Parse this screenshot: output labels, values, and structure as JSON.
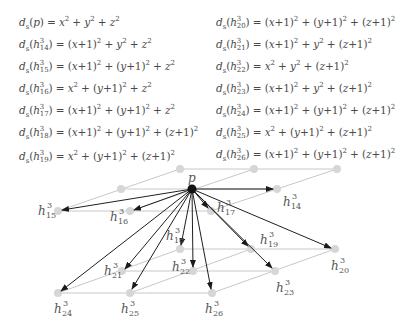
{
  "equations": {
    "left": [
      {
        "lhs": "d_s(p)",
        "rhs": "x^2 + y^2 + z^2",
        "text": "ds(p) = x² + y² + z²"
      },
      {
        "lhs": "d_s(h^3_14)",
        "rhs": "(x+1)^2 + y^2 + z^2",
        "text": "ds(h³₁₄) = (x+1)² + y² + z²"
      },
      {
        "lhs": "d_s(h^3_15)",
        "rhs": "(x+1)^2 + (y+1)^2 + z^2",
        "text": "ds(h³₁₅) = (x+1)² + (y+1)² + z²"
      },
      {
        "lhs": "d_s(h^3_16)",
        "rhs": "x^2 + (y+1)^2 + z^2",
        "text": "ds(h³₁₆) = x² + (y+1)² + z²"
      },
      {
        "lhs": "d_s(h^3_17)",
        "rhs": "(x+1)^2 + (y+1)^2 + z^2",
        "text": "ds(h³₁₇) = (x+1)² + (y+1)² + z²"
      },
      {
        "lhs": "d_s(h^3_18)",
        "rhs": "(x+1)^2 + (y+1)^2 + (z+1)^2",
        "text": "ds(h³₁₈) = (x+1)² + (y+1)² + (z+1)²"
      },
      {
        "lhs": "d_s(h^3_19)",
        "rhs": "x^2 + (y+1)^2 + (z+1)^2",
        "text": "ds(h³₁₉) = x² + (y+1)² + (z+1)²"
      }
    ],
    "right": [
      {
        "lhs": "d_s(h^3_20)",
        "rhs": "(x+1)^2 + (y+1)^2 + (z+1)^2",
        "text": "ds(h³₂₀) = (x+1)² + (y+1)² + (z+1)²"
      },
      {
        "lhs": "d_s(h^3_21)",
        "rhs": "(x+1)^2 + y^2 + (z+1)^2",
        "text": "ds(h³₂₁) = (x+1)² + y² + (z+1)²"
      },
      {
        "lhs": "d_s(h^3_22)",
        "rhs": "x^2 + y^2 + (z+1)^2",
        "text": "ds(h³₂₂) = x² + y² + (z+1)²"
      },
      {
        "lhs": "d_s(h^3_23)",
        "rhs": "(x+1)^2 + y^2 + (z+1)^2",
        "text": "ds(h³₂₃) = (x+1)² + y² + (z+1)²"
      },
      {
        "lhs": "d_s(h^3_24)",
        "rhs": "(x+1)^2 + (y+1)^2 + (z+1)^2",
        "text": "ds(h³₂₄) = (x+1)² + (y+1)² + (z+1)²"
      },
      {
        "lhs": "d_s(h^3_25)",
        "rhs": "x^2 + (y+1)^2 + (z+1)^2",
        "text": "ds(h³₂₅) = x² + (y+1)² + (z+1)²"
      },
      {
        "lhs": "d_s(h^3_26)",
        "rhs": "(x+1)^2 + (y+1)^2 + (z+1)^2",
        "text": "ds(h³₂₆) = (x+1)² + (y+1)² + (z+1)²"
      }
    ]
  },
  "diagram": {
    "source_label": "p",
    "labels": {
      "h14": {
        "base": "h",
        "sup": "3",
        "sub": "14"
      },
      "h15": {
        "base": "h",
        "sup": "3",
        "sub": "15"
      },
      "h16": {
        "base": "h",
        "sup": "3",
        "sub": "16"
      },
      "h17": {
        "base": "h",
        "sup": "3",
        "sub": "17"
      },
      "h18": {
        "base": "h",
        "sup": "3",
        "sub": "18"
      },
      "h19": {
        "base": "h",
        "sup": "3",
        "sub": "19"
      },
      "h20": {
        "base": "h",
        "sup": "3",
        "sub": "20"
      },
      "h21": {
        "base": "h",
        "sup": "3",
        "sub": "21"
      },
      "h22": {
        "base": "h",
        "sup": "3",
        "sub": "22"
      },
      "h23": {
        "base": "h",
        "sup": "3",
        "sub": "23"
      },
      "h24": {
        "base": "h",
        "sup": "3",
        "sub": "24"
      },
      "h25": {
        "base": "h",
        "sup": "3",
        "sub": "25"
      },
      "h26": {
        "base": "h",
        "sup": "3",
        "sub": "26"
      }
    },
    "colors": {
      "grid_line": "#c8c8c8",
      "node_gray": "#d4d4d4",
      "arrow": "#222222",
      "source_node": "#111111",
      "text": "#4a4a4a"
    }
  }
}
